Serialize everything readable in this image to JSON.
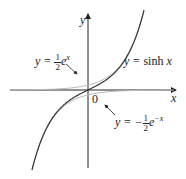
{
  "figure": {
    "x_axis_label": "x",
    "y_axis_label": "y",
    "origin_label": "0",
    "curves": [
      {
        "name": "sinh",
        "label_prefix": "y = ",
        "label_fn": "sinh",
        "label_var": " x",
        "color": "#333333"
      },
      {
        "name": "half-exp",
        "label_prefix": "y = ",
        "num": "1",
        "den": "2",
        "base": "e",
        "exp": "x",
        "color": "#bbbbbb"
      },
      {
        "name": "neg-half-exp-neg",
        "label_prefix": "y = −",
        "num": "1",
        "den": "2",
        "base": "e",
        "exp": "−x",
        "color": "#bbbbbb"
      }
    ]
  }
}
